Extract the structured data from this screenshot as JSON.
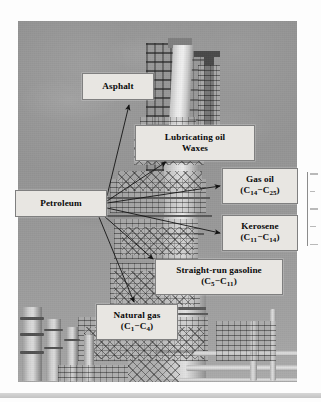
{
  "figure": {
    "type": "annotated-photograph",
    "photo_description": "Black and white photograph of an oil refinery with distillation columns and piping"
  },
  "callouts": [
    {
      "id": "asphalt",
      "line1": "Asphalt",
      "line2": "",
      "sub1": "",
      "sub2": ""
    },
    {
      "id": "lubricating",
      "line1": "Lubricating oil",
      "line2": "Waxes",
      "sub1": "",
      "sub2": ""
    },
    {
      "id": "gas_oil",
      "line1": "Gas oil",
      "line2": "(C",
      "sub1": "14",
      "sub2": "25"
    },
    {
      "id": "petroleum",
      "line1": "Petroleum",
      "line2": "",
      "sub1": "",
      "sub2": ""
    },
    {
      "id": "kerosene",
      "line1": "Kerosene",
      "line2": "(C",
      "sub1": "11",
      "sub2": "14"
    },
    {
      "id": "straight_run",
      "line1": "Straight-run gasoline",
      "line2": "(C",
      "sub1": "5",
      "sub2": "11"
    },
    {
      "id": "natural_gas",
      "line1": "Natural gas",
      "line2": "(C",
      "sub1": "1",
      "sub2": "4"
    }
  ],
  "labels": {
    "asphalt": "Asphalt",
    "lubricating_oil": "Lubricating oil",
    "waxes": "Waxes",
    "gas_oil": "Gas oil",
    "gas_oil_range_open": "(C",
    "gas_oil_sub_low": "14",
    "gas_oil_dash": "−C",
    "gas_oil_sub_high": "25",
    "gas_oil_close": ")",
    "petroleum": "Petroleum",
    "kerosene": "Kerosene",
    "kerosene_range_open": "(C",
    "kerosene_sub_low": "11",
    "kerosene_dash": "−C",
    "kerosene_sub_high": "14",
    "kerosene_close": ")",
    "straight_run_gasoline": "Straight-run gasoline",
    "straight_run_range_open": "(C",
    "straight_run_sub_low": "5",
    "straight_run_dash": "−C",
    "straight_run_sub_high": "11",
    "straight_run_close": ")",
    "natural_gas": "Natural gas",
    "natural_gas_range_open": "(C",
    "natural_gas_sub_low": "1",
    "natural_gas_dash": "−C",
    "natural_gas_sub_high": "4",
    "natural_gas_close": ")"
  },
  "connections": [
    {
      "from": "petroleum",
      "to": "asphalt"
    },
    {
      "from": "petroleum",
      "to": "lubricating_oil_waxes"
    },
    {
      "from": "petroleum",
      "to": "gas_oil"
    },
    {
      "from": "petroleum",
      "to": "kerosene"
    },
    {
      "from": "petroleum",
      "to": "straight_run_gasoline"
    },
    {
      "from": "petroleum",
      "to": "natural_gas"
    }
  ],
  "colors": {
    "callout_fill": "#e8e6e2",
    "callout_border": "#7f7f7f",
    "text": "#0a0a0a",
    "arrow": "#1a1a1a",
    "page_background": "#fdfdfd",
    "photo_sky": "#939496"
  }
}
